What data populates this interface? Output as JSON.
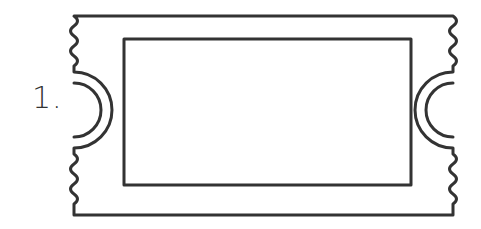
{
  "figure": {
    "label": "1.",
    "stroke_color": "#333333",
    "background_color": "#ffffff"
  }
}
